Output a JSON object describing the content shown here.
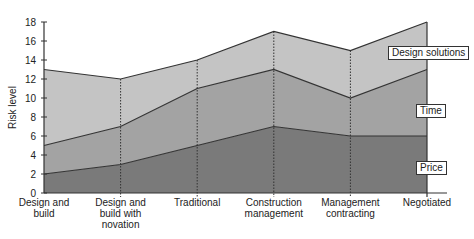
{
  "chart_data": {
    "type": "area",
    "stacked": true,
    "title": "",
    "xlabel": "",
    "ylabel": "Risk level",
    "ylim": [
      0,
      18
    ],
    "yticks": [
      0,
      2,
      4,
      6,
      8,
      10,
      12,
      14,
      16,
      18
    ],
    "grid": false,
    "categories": [
      "Design and build",
      "Design and build with novation",
      "Traditional",
      "Construction management",
      "Management contracting",
      "Negotiated"
    ],
    "category_lines": [
      [
        "Design and",
        "build"
      ],
      [
        "Design and",
        "build with",
        "novation"
      ],
      [
        "Traditional"
      ],
      [
        "Construction",
        "management"
      ],
      [
        "Management",
        "contracting"
      ],
      [
        "Negotiated"
      ]
    ],
    "series": [
      {
        "name": "Price",
        "values": [
          2,
          3,
          5,
          7,
          6,
          6
        ],
        "cumulative": [
          2,
          3,
          5,
          7,
          6,
          6
        ],
        "color": "#7a7a7a"
      },
      {
        "name": "Time",
        "values": [
          3,
          4,
          6,
          6,
          4,
          7
        ],
        "cumulative": [
          5,
          7,
          11,
          13,
          10,
          13
        ],
        "color": "#a3a3a3"
      },
      {
        "name": "Design solutions",
        "values": [
          8,
          5,
          3,
          4,
          5,
          5
        ],
        "cumulative": [
          13,
          12,
          14,
          17,
          15,
          18
        ],
        "color": "#c4c4c4"
      }
    ],
    "legend_position": "right, inline labels"
  },
  "labels": {
    "design_solutions": "Design solutions",
    "time": "Time",
    "price": "Price",
    "y_axis_title": "Risk level"
  }
}
